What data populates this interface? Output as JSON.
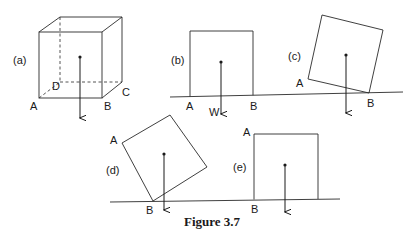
{
  "figure": {
    "caption": "Figure 3.7"
  },
  "panels": {
    "a": {
      "label": "(a)",
      "corners": {
        "A": "A",
        "B": "B",
        "C": "C",
        "D": "D"
      }
    },
    "b": {
      "label": "(b)",
      "corners": {
        "A": "A",
        "B": "B"
      },
      "force_label": "W"
    },
    "c": {
      "label": "(c)",
      "corners": {
        "A": "A",
        "B": "B"
      }
    },
    "d": {
      "label": "(d)",
      "corners": {
        "A": "A",
        "B": "B"
      }
    },
    "e": {
      "label": "(e)",
      "corners": {
        "A": "A",
        "B": "B"
      }
    }
  },
  "colors": {
    "line": "#2a2a2a",
    "background": "#ffffff"
  }
}
